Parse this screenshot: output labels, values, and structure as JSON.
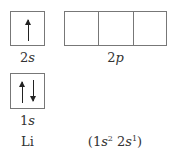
{
  "diagram": {
    "element": "Li",
    "configuration": {
      "open": "(",
      "parts": [
        {
          "orbital": "1",
          "letter": "s",
          "electrons": "2"
        },
        {
          "orbital": "2",
          "letter": "s",
          "electrons": "1"
        }
      ],
      "close": ")"
    },
    "orbitals": [
      {
        "id": "2s",
        "number": "2",
        "letter": "s",
        "boxes": 1,
        "arrows": [
          "up"
        ]
      },
      {
        "id": "2p",
        "number": "2",
        "letter": "p",
        "boxes": 3,
        "arrows": []
      },
      {
        "id": "1s",
        "number": "1",
        "letter": "s",
        "boxes": 1,
        "arrows": [
          "up",
          "down"
        ]
      }
    ],
    "colors": {
      "box_border": "#777777",
      "arrow": "#222222",
      "text": "#333333"
    }
  }
}
